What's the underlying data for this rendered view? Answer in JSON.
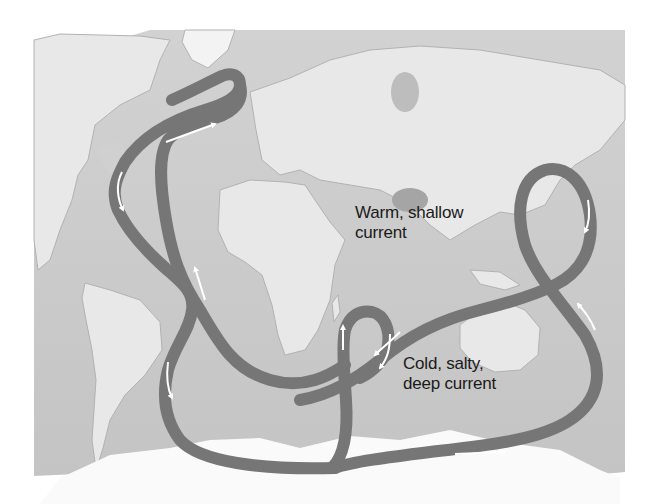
{
  "figure": {
    "colors": {
      "background": "#ffffff",
      "ocean": "#c9c9c9",
      "land": "#e6e6e6",
      "land_shadow": "#a9a9a9",
      "ice": "#f7f7f7",
      "current_band": "#767676",
      "arrow": "#ffffff",
      "text": "#1a1a1a"
    }
  },
  "labels": {
    "warm": {
      "line1": "Warm, shallow",
      "line2": "current"
    },
    "cold": {
      "line1": "Cold, salty,",
      "line2": "deep current"
    }
  },
  "legend": [
    {
      "name": "warm-shallow-current",
      "text": "Warm, shallow current"
    },
    {
      "name": "cold-deep-current",
      "text": "Cold, salty, deep current"
    }
  ]
}
